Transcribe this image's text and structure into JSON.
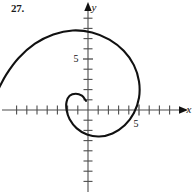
{
  "figure": {
    "problem_number": "27.",
    "caption": ""
  },
  "axes": {
    "y_axis_label": "y",
    "x_axis_label": "x",
    "x_tick_label": "5",
    "y_tick_label": "5",
    "origin_px": {
      "x": 88,
      "y": 110
    },
    "unit_px": 10.2,
    "x_range": [
      -8.4,
      10.0
    ],
    "y_range": [
      -8.2,
      10.0
    ],
    "tick_spacing_units": 1,
    "grid": false,
    "axis_color": "#4d4d4d",
    "curve_color": "#111111"
  },
  "chart_data": {
    "type": "line",
    "title": "",
    "subtitle": "",
    "xlabel": "x",
    "ylabel": "y",
    "xlim": [
      -8.4,
      10.0
    ],
    "ylim": [
      -8.2,
      10.0
    ],
    "grid": false,
    "legend": "none",
    "annotations": [
      "27."
    ],
    "tick_labels": {
      "x": [
        "5"
      ],
      "y": [
        "5"
      ]
    },
    "curve_name": "spiral",
    "polar_form": "r = a * theta (Archimedean-like spiral)",
    "theta_start_deg": 450,
    "theta_end_deg": -45,
    "series": [
      {
        "name": "spiral",
        "points": [
          [
            -0.2,
            0.9
          ],
          [
            -0.6,
            1.4
          ],
          [
            -1.2,
            1.6
          ],
          [
            -1.8,
            1.4
          ],
          [
            -2.1,
            0.8
          ],
          [
            -2.1,
            0.0
          ],
          [
            -1.8,
            -0.9
          ],
          [
            -1.1,
            -1.8
          ],
          [
            -0.1,
            -2.4
          ],
          [
            1.1,
            -2.6
          ],
          [
            2.4,
            -2.3
          ],
          [
            3.6,
            -1.5
          ],
          [
            4.5,
            -0.3
          ],
          [
            5.0,
            1.2
          ],
          [
            5.0,
            2.8
          ],
          [
            4.5,
            4.4
          ],
          [
            3.5,
            5.8
          ],
          [
            2.1,
            6.9
          ],
          [
            0.4,
            7.6
          ],
          [
            -1.5,
            7.8
          ],
          [
            -3.4,
            7.4
          ],
          [
            -5.2,
            6.5
          ],
          [
            -6.8,
            5.1
          ],
          [
            -8.0,
            3.5
          ],
          [
            -8.7,
            2.2
          ]
        ]
      }
    ]
  }
}
